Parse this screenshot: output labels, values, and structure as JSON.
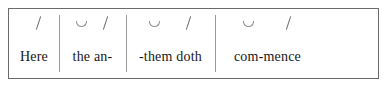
{
  "figure": {
    "type": "scansion-diagram",
    "line_text": "Here the an--them doth com-mence",
    "meter_note": "",
    "border_color": "#6b6b6b",
    "divider_color": "#9a9a9a",
    "text_color": "#17171a",
    "mark_color": "#6a6a70",
    "feet": [
      {
        "index": 1,
        "syllables": "Here",
        "marks": [
          "stress"
        ],
        "mark_symbols": [
          "/"
        ]
      },
      {
        "index": 2,
        "syllables": "the an-",
        "marks": [
          "unstress",
          "stress"
        ],
        "mark_symbols": [
          "˘",
          "/"
        ]
      },
      {
        "index": 3,
        "syllables": "-them doth",
        "marks": [
          "unstress",
          "stress"
        ],
        "mark_symbols": [
          "˘",
          "/"
        ]
      },
      {
        "index": 4,
        "syllables": "com-mence",
        "marks": [
          "unstress",
          "stress"
        ],
        "mark_symbols": [
          "˘",
          "/"
        ]
      }
    ]
  }
}
